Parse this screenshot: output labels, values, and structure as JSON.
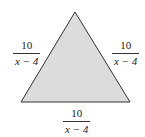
{
  "diagram": {
    "shape": "equilateral-triangle",
    "fill_color": "#dcdcdc",
    "stroke_color": "#333333",
    "labels": {
      "left_side": {
        "numerator": "10",
        "denominator": "x − 4"
      },
      "right_side": {
        "numerator": "10",
        "denominator": "x − 4"
      },
      "bottom_side": {
        "numerator": "10",
        "denominator": "x − 4"
      }
    }
  }
}
